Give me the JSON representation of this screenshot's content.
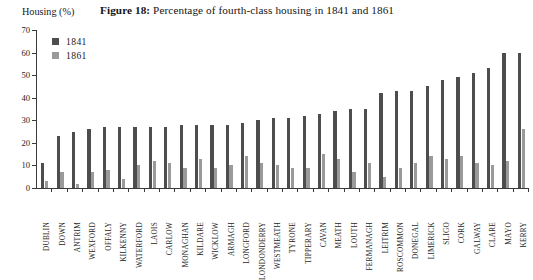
{
  "figure": {
    "number_label": "Figure 18:",
    "title_text": "Percentage of fourth-class housing in 1841 and 1861",
    "axis_caption": "Housing (%)"
  },
  "legend": {
    "position": "top-left-inside",
    "entries": [
      {
        "label": "1841",
        "color": "#4d4d4d"
      },
      {
        "label": "1861",
        "color": "#9a9a9a"
      }
    ]
  },
  "colors": {
    "series_1841": "#4d4d4d",
    "series_1861": "#9a9a9a",
    "axis": "#3a3a3a",
    "text": "#1a1a1a",
    "background": "#ffffff"
  },
  "chart_data": {
    "type": "bar",
    "title": "Figure 18: Percentage of fourth-class housing in 1841 and 1861",
    "xlabel": "",
    "ylabel": "Housing (%)",
    "ylim": [
      0,
      70
    ],
    "yticks": [
      0,
      10,
      20,
      30,
      40,
      50,
      60,
      70
    ],
    "grid": false,
    "legend_position": "upper left",
    "categories": [
      "DUBLIN",
      "DOWN",
      "ANTRIM",
      "WEXFORD",
      "OFFALY",
      "KILKENNY",
      "WATERFORD",
      "LAOIS",
      "CARLOW",
      "MONAGHAN",
      "KILDARE",
      "WICKLOW",
      "ARMAGH",
      "LONGFORD",
      "LONDONDERRY",
      "WESTMEATH",
      "TYRONE",
      "TIPPERARY",
      "CAVAN",
      "MEATH",
      "LOUTH",
      "FERMANAGH",
      "LEITRIM",
      "ROSCOMMON",
      "DONEGAL",
      "LIMERICK",
      "SLIGO",
      "CORK",
      "GALWAY",
      "CLARE",
      "MAYO",
      "KERRY"
    ],
    "series": [
      {
        "name": "1841",
        "color": "#4d4d4d",
        "values": [
          11,
          23,
          25,
          26,
          27,
          27,
          27,
          27,
          27,
          28,
          28,
          28,
          28,
          29,
          30,
          31,
          31,
          32,
          33,
          34,
          35,
          35,
          42,
          43,
          43,
          45,
          48,
          49,
          51,
          53,
          60,
          60
        ]
      },
      {
        "name": "1861",
        "color": "#9a9a9a",
        "values": [
          3,
          7,
          2,
          7,
          8,
          4,
          10,
          12,
          11,
          9,
          13,
          9,
          10,
          14,
          11,
          10,
          9,
          9,
          15,
          13,
          7,
          11,
          5,
          9,
          11,
          14,
          13,
          14,
          11,
          10,
          12,
          26
        ]
      }
    ]
  }
}
